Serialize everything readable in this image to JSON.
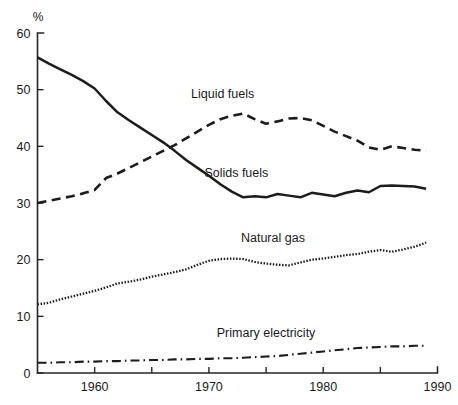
{
  "chart_data": {
    "type": "line",
    "title": "",
    "xlabel": "",
    "ylabel": "%",
    "yunit_label": "%",
    "xlim": [
      1955,
      1990
    ],
    "ylim": [
      0,
      60
    ],
    "grid": false,
    "legend_position": "inline-annotations",
    "y_ticks": [
      0,
      10,
      20,
      30,
      40,
      50,
      60
    ],
    "y_tick_labels": [
      "0",
      "10",
      "20",
      "30",
      "40",
      "50",
      "60"
    ],
    "x_ticks": [
      1960,
      1965,
      1970,
      1975,
      1980,
      1985,
      1990
    ],
    "x_tick_labels": [
      "1960",
      "",
      "1970",
      "",
      "1980",
      "",
      "1990"
    ],
    "x_labeled_ticks": [
      1960,
      1970,
      1980,
      1990
    ],
    "series": [
      {
        "name": "Solids fuels",
        "line_style": "solid",
        "label_x": 1972.4,
        "label_y": 34.6,
        "x": [
          1955,
          1956,
          1957,
          1958,
          1959,
          1960,
          1961,
          1962,
          1963,
          1964,
          1965,
          1966,
          1967,
          1968,
          1969,
          1970,
          1971,
          1972,
          1973,
          1974,
          1975,
          1976,
          1977,
          1978,
          1979,
          1980,
          1981,
          1982,
          1983,
          1984,
          1985,
          1986,
          1987,
          1988,
          1989
        ],
        "values": [
          55.7,
          54.6,
          53.6,
          52.6,
          51.5,
          50.2,
          48.0,
          46.0,
          44.6,
          43.3,
          42.0,
          40.7,
          39.2,
          37.6,
          36.2,
          34.8,
          33.3,
          32.0,
          31.0,
          31.2,
          31.0,
          31.6,
          31.3,
          31.0,
          31.8,
          31.5,
          31.2,
          31.8,
          32.2,
          31.9,
          33.0,
          33.1,
          33.0,
          32.9,
          32.5
        ]
      },
      {
        "name": "Liquid fuels",
        "line_style": "dashed",
        "label_x": 1971.2,
        "label_y": 48.6,
        "x": [
          1955,
          1956,
          1957,
          1958,
          1959,
          1960,
          1961,
          1962,
          1963,
          1964,
          1965,
          1966,
          1967,
          1968,
          1969,
          1970,
          1971,
          1972,
          1973,
          1974,
          1975,
          1976,
          1977,
          1978,
          1979,
          1980,
          1981,
          1982,
          1983,
          1984,
          1985,
          1986,
          1987,
          1988,
          1989
        ],
        "values": [
          30.0,
          30.4,
          30.8,
          31.2,
          31.7,
          32.3,
          34.4,
          35.2,
          36.2,
          37.2,
          38.2,
          39.2,
          40.2,
          41.4,
          42.6,
          43.8,
          44.8,
          45.4,
          45.8,
          44.8,
          44.0,
          44.4,
          44.9,
          45.0,
          44.6,
          43.6,
          42.6,
          41.8,
          41.0,
          39.8,
          39.4,
          40.0,
          39.7,
          39.4,
          39.2
        ]
      },
      {
        "name": "Natural gas",
        "line_style": "dotted",
        "label_x": 1975.6,
        "label_y": 23.2,
        "x": [
          1955,
          1956,
          1957,
          1958,
          1959,
          1960,
          1961,
          1962,
          1963,
          1964,
          1965,
          1966,
          1967,
          1968,
          1969,
          1970,
          1971,
          1972,
          1973,
          1974,
          1975,
          1976,
          1977,
          1978,
          1979,
          1980,
          1981,
          1982,
          1983,
          1984,
          1985,
          1986,
          1987,
          1988,
          1989
        ],
        "values": [
          12.1,
          12.4,
          13.0,
          13.5,
          14.0,
          14.5,
          15.1,
          15.8,
          16.1,
          16.5,
          17.0,
          17.4,
          17.8,
          18.3,
          19.1,
          19.8,
          20.1,
          20.2,
          20.1,
          19.6,
          19.3,
          19.1,
          19.0,
          19.5,
          20.0,
          20.2,
          20.5,
          20.8,
          21.0,
          21.4,
          21.7,
          21.4,
          21.8,
          22.3,
          23.0
        ]
      },
      {
        "name": "Primary electricity",
        "line_style": "dash-dot",
        "label_x": 1975.0,
        "label_y": 6.4,
        "x": [
          1955,
          1956,
          1957,
          1958,
          1959,
          1960,
          1961,
          1962,
          1963,
          1964,
          1965,
          1966,
          1967,
          1968,
          1969,
          1970,
          1971,
          1972,
          1973,
          1974,
          1975,
          1976,
          1977,
          1978,
          1979,
          1980,
          1981,
          1982,
          1983,
          1984,
          1985,
          1986,
          1987,
          1988,
          1989
        ],
        "values": [
          1.8,
          1.8,
          1.9,
          1.9,
          2.0,
          2.0,
          2.1,
          2.1,
          2.2,
          2.2,
          2.3,
          2.3,
          2.4,
          2.4,
          2.5,
          2.5,
          2.6,
          2.6,
          2.7,
          2.8,
          2.9,
          3.0,
          3.2,
          3.4,
          3.6,
          3.8,
          4.0,
          4.2,
          4.4,
          4.5,
          4.6,
          4.7,
          4.7,
          4.8,
          4.8
        ]
      }
    ]
  }
}
